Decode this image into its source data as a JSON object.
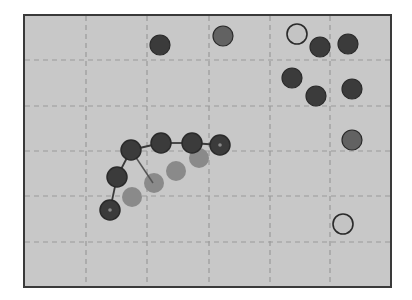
{
  "board": {
    "x": 23,
    "y": 14,
    "width": 369,
    "height": 274,
    "background": "#c8c8c8",
    "border_color": "#3a3a3a",
    "grid_color": "#9a9a9a",
    "vertical_lines": [
      86,
      147,
      209,
      270,
      330
    ],
    "horizontal_lines": [
      60,
      106,
      151,
      196,
      242
    ],
    "columns": 6,
    "rows": 6
  },
  "colors": {
    "dark": "#3b3b3b",
    "medium": "#626262",
    "faded": "#8a8a8a",
    "light": "#c4c4c4",
    "outline": "#2a2a2a",
    "link": "#3a3a3a"
  },
  "chain": {
    "label": "snake-chain",
    "nodes": [
      {
        "x": 110,
        "y": 210,
        "type": "dark",
        "marker": true
      },
      {
        "x": 117,
        "y": 177,
        "type": "dark",
        "marker": false
      },
      {
        "x": 131,
        "y": 150,
        "type": "dark",
        "marker": false
      },
      {
        "x": 161,
        "y": 143,
        "type": "dark",
        "marker": false
      },
      {
        "x": 192,
        "y": 143,
        "type": "dark",
        "marker": false
      },
      {
        "x": 220,
        "y": 145,
        "type": "dark",
        "marker": true
      }
    ],
    "branch": {
      "from": {
        "x": 131,
        "y": 150
      },
      "to": {
        "x": 153,
        "y": 183
      }
    }
  },
  "trail": [
    {
      "x": 132,
      "y": 197,
      "type": "faded"
    },
    {
      "x": 154,
      "y": 183,
      "type": "faded"
    },
    {
      "x": 176,
      "y": 171,
      "type": "faded"
    },
    {
      "x": 199,
      "y": 158,
      "type": "faded"
    }
  ],
  "pieces": [
    {
      "x": 160,
      "y": 45,
      "type": "dark"
    },
    {
      "x": 223,
      "y": 36,
      "type": "medium"
    },
    {
      "x": 297,
      "y": 34,
      "type": "light"
    },
    {
      "x": 320,
      "y": 47,
      "type": "dark"
    },
    {
      "x": 348,
      "y": 44,
      "type": "dark"
    },
    {
      "x": 292,
      "y": 78,
      "type": "dark"
    },
    {
      "x": 316,
      "y": 96,
      "type": "dark"
    },
    {
      "x": 352,
      "y": 89,
      "type": "dark"
    },
    {
      "x": 352,
      "y": 140,
      "type": "medium"
    },
    {
      "x": 343,
      "y": 224,
      "type": "light"
    }
  ],
  "piece_radius": 10
}
